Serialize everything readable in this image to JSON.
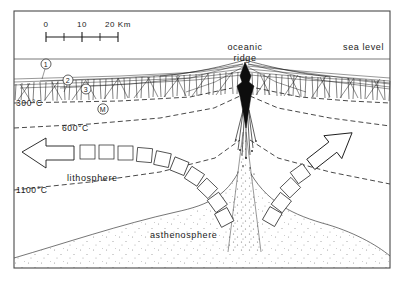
{
  "figure": {
    "background_color": "#ffffff",
    "ink_color": "#1a1a1a",
    "frame_color": "#4a4a4a"
  },
  "scale_bar": {
    "ticks": [
      "0",
      "10",
      "20 Km"
    ],
    "unit": "Km",
    "min_km": 0,
    "max_km": 20
  },
  "labels": {
    "oceanic": "oceanic",
    "ridge": "ridge",
    "sea_level": "sea level",
    "lithosphere": "lithosphere",
    "asthenosphere": "asthenosphere"
  },
  "isotherms": [
    {
      "id": "iso-300",
      "label": "300°C",
      "value_c": 300,
      "dash": true
    },
    {
      "id": "iso-600",
      "label": "600°C",
      "value_c": 600,
      "dash": true
    },
    {
      "id": "iso-1100",
      "label": "1100°C",
      "value_c": 1100,
      "dash": true
    }
  ],
  "markers": [
    {
      "id": "marker-1",
      "label": "1"
    },
    {
      "id": "marker-2",
      "label": "2"
    },
    {
      "id": "marker-3",
      "label": "3"
    },
    {
      "id": "marker-m",
      "label": "M"
    }
  ],
  "arrows": [
    {
      "id": "arrow-left",
      "direction": "left",
      "meaning": "plate spreading west"
    },
    {
      "id": "arrow-right",
      "direction": "up-right",
      "meaning": "plate spreading east"
    }
  ]
}
